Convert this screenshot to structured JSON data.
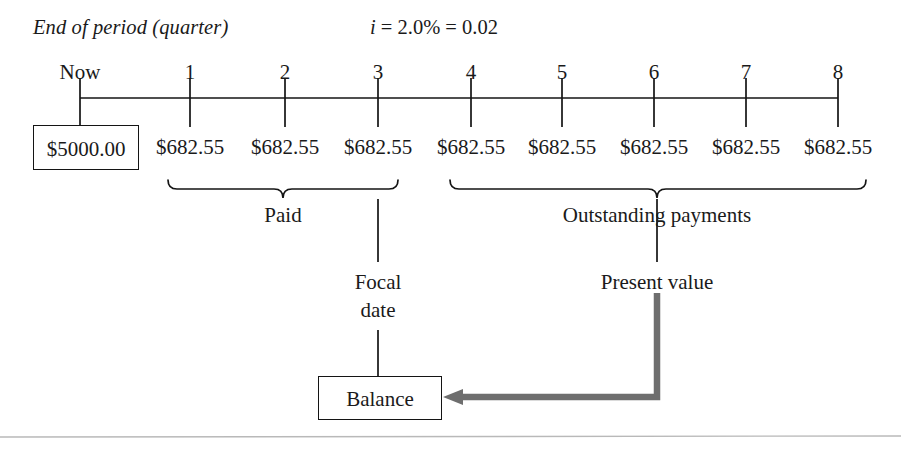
{
  "diagram": {
    "period_caption": "End of period (quarter)",
    "interest_rate": {
      "symbol": "i",
      "text": " = 2.0% = 0.02"
    },
    "timeline": {
      "start_label": "Now",
      "tick_labels": [
        "1",
        "2",
        "3",
        "4",
        "5",
        "6",
        "7",
        "8"
      ],
      "tick_x": [
        80,
        190,
        285,
        378,
        471,
        562,
        654,
        746,
        838
      ],
      "axis_y": 98,
      "tick_top": 78,
      "tick_bottom": 118
    },
    "principal": {
      "amount": "$5000.00"
    },
    "payments": [
      {
        "label": "$682.55",
        "x": 190
      },
      {
        "label": "$682.55",
        "x": 285
      },
      {
        "label": "$682.55",
        "x": 378
      },
      {
        "label": "$682.55",
        "x": 471
      },
      {
        "label": "$682.55",
        "x": 562
      },
      {
        "label": "$682.55",
        "x": 654
      },
      {
        "label": "$682.55",
        "x": 746
      },
      {
        "label": "$682.55",
        "x": 838
      }
    ],
    "braces": {
      "paid": {
        "caption": "Paid",
        "x_start": 168,
        "x_end": 398,
        "y": 180
      },
      "outstanding": {
        "caption": "Outstanding payments",
        "x_start": 450,
        "x_end": 866,
        "y": 180
      }
    },
    "focal_date": {
      "line1": "Focal",
      "line2": "date"
    },
    "present_value": {
      "caption": "Present value"
    },
    "balance": {
      "label": "Balance"
    },
    "colors": {
      "ink": "#141414",
      "arrow": "#6e6e6e",
      "rule": "#b9b9b9",
      "background": "#ffffff"
    }
  }
}
